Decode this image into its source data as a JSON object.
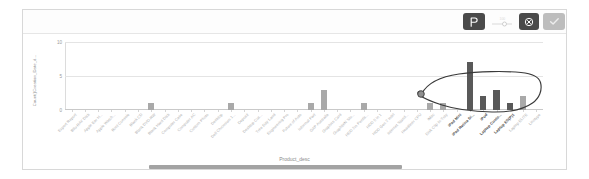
{
  "toolbar": {
    "lasso_label": "P",
    "lasso_icon": "lasso-select-icon",
    "zoom_icon": "zoom-slider-icon",
    "cancel_icon": "cancel-circle-icon",
    "confirm_icon": "checkmark-icon"
  },
  "chart_data": {
    "type": "bar",
    "title": "",
    "xlabel": "Product_desc",
    "ylabel": "Count()Creation_Date_d...",
    "ylim": [
      0,
      10
    ],
    "yticks": [
      "0",
      "5",
      "10"
    ],
    "ytick_values": [
      0,
      5,
      10
    ],
    "grid": true,
    "legend": "none",
    "selection": {
      "type": "lasso",
      "selected_categories": [
        "iPad Mini",
        "iPad Retina Di...",
        "iPod",
        "Laptop Custo...",
        "Laptop ES(P)1"
      ]
    },
    "categories": [
      "Export Report",
      "Bllu-RAY Disk",
      "Apple Ear H...",
      "Apple Watch...",
      "Boot Console",
      "Blank CD",
      "Blank DVD-RW",
      "Blank Hard Disk",
      "Computer Case",
      "Computer AC",
      "Custom Photo",
      "Desktop",
      "Dell Chromium 1...",
      "Deposit",
      "Desktop Cus...",
      "Tree Day Land",
      "Engineering Pro",
      "Future of Auto",
      "Informal Part",
      "GAP Australia",
      "Graphics Card",
      "GraphiteN Stu...",
      "HDD 2m Pentis...",
      "HDD 5 in 1",
      "HDD Gen 2 Intel",
      "Internet Stand...",
      "Headliner CPU",
      "iMac",
      "Disk Clip In-Tray",
      "iPad Mini",
      "iPad Retina Di...",
      "iPod",
      "Laptop Custo...",
      "Laptop ES(P)1",
      "Laptop ELITE",
      "Linotype"
    ],
    "values": [
      0,
      0,
      0,
      0,
      0,
      0,
      1,
      0,
      0,
      0,
      0,
      0,
      1,
      0,
      0,
      0,
      0,
      0,
      1,
      3,
      0,
      0,
      1,
      0,
      0,
      0,
      0,
      1,
      1,
      0,
      7,
      2,
      3,
      1,
      2,
      0
    ],
    "colors": {
      "unselected_bar": "#a9a9a9",
      "selected_bar": "#595959",
      "gridline": "#e4e4e4",
      "axis": "#c9c9c9",
      "label": "#b0b0b0",
      "selected_label": "#4a4a4a"
    }
  },
  "scrollbar": {
    "name": "horizontal-scrollbar",
    "orientation": "horizontal"
  }
}
